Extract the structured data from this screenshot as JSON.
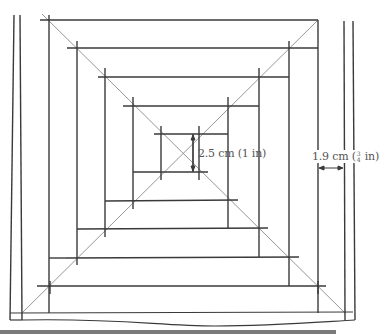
{
  "figure": {
    "title": "",
    "stroke_color": "#3a3a3a",
    "diagonal_color": "#8a8a8a",
    "bar_color": "#7a7a7a"
  },
  "labels": {
    "inner_spacing": {
      "text": "2.5 cm (1 in)",
      "value_cm": "2.5 cm",
      "value_in": "(1 in)"
    },
    "margin": {
      "text": "1.9 cm (3/4 in)",
      "value_cm": "1.9 cm",
      "value_in_open": "(",
      "frac_num": "3",
      "frac_den": "4",
      "value_in_close": "in)"
    }
  },
  "squares": [
    {
      "left": 49,
      "top": 20,
      "right": 318,
      "bottom": 286
    },
    {
      "left": 77,
      "top": 48,
      "right": 289,
      "bottom": 257
    },
    {
      "left": 105,
      "top": 77,
      "right": 259,
      "bottom": 229
    },
    {
      "left": 133,
      "top": 106,
      "right": 228,
      "bottom": 201
    },
    {
      "left": 161,
      "top": 134,
      "right": 199,
      "bottom": 172
    }
  ]
}
